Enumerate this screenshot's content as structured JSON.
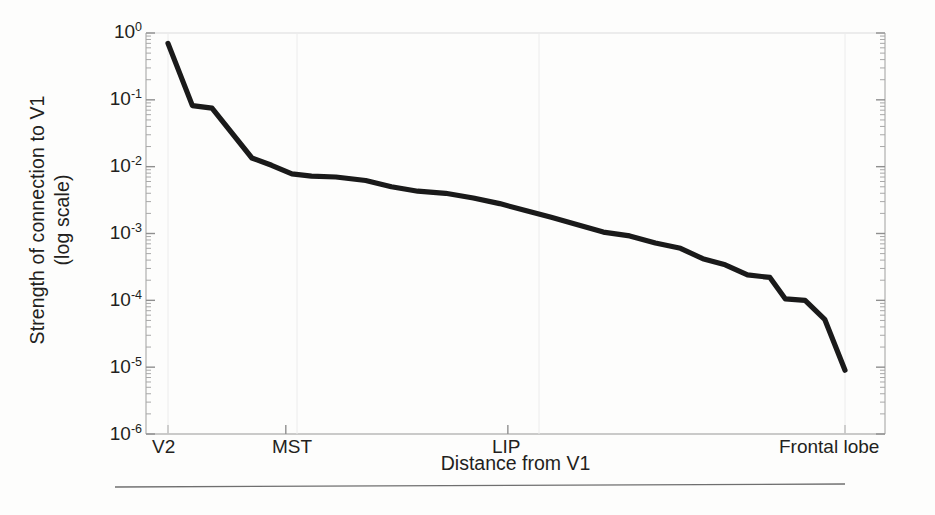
{
  "chart_data": {
    "type": "line",
    "title": "",
    "xlabel": "Distance from V1",
    "ylabel": "Strength of connection to V1\n(log scale)",
    "yscale": "log",
    "ylim": [
      1e-06,
      1
    ],
    "ytick_labels": [
      "10^0",
      "10^-1",
      "10^-2",
      "10^-3",
      "10^-4",
      "10^-5",
      "10^-6"
    ],
    "ytick_values": [
      1,
      0.1,
      0.01,
      0.001,
      0.0001,
      1e-05,
      1e-06
    ],
    "xtick_labels": [
      "V2",
      "MST",
      "LIP",
      "Frontal lobe"
    ],
    "xtick_positions": [
      0,
      0.174,
      0.502,
      1.0
    ],
    "grid": false,
    "legend": null,
    "series": [
      {
        "name": "Connection strength",
        "x": [
          0.0,
          0.036,
          0.065,
          0.124,
          0.153,
          0.183,
          0.212,
          0.248,
          0.292,
          0.33,
          0.369,
          0.41,
          0.451,
          0.49,
          0.528,
          0.566,
          0.605,
          0.643,
          0.682,
          0.72,
          0.757,
          0.79,
          0.823,
          0.856,
          0.889,
          0.912,
          0.941,
          0.97,
          1.0
        ],
        "values": [
          0.7,
          0.082,
          0.075,
          0.0135,
          0.0105,
          0.0078,
          0.0072,
          0.007,
          0.0062,
          0.005,
          0.0043,
          0.004,
          0.0034,
          0.0028,
          0.0022,
          0.00175,
          0.00135,
          0.00105,
          0.00092,
          0.00072,
          0.0006,
          0.00042,
          0.00034,
          0.00024,
          0.00022,
          0.000105,
          0.0001,
          5.2e-05,
          9e-06
        ]
      }
    ]
  },
  "footer": {
    "rule": ""
  }
}
